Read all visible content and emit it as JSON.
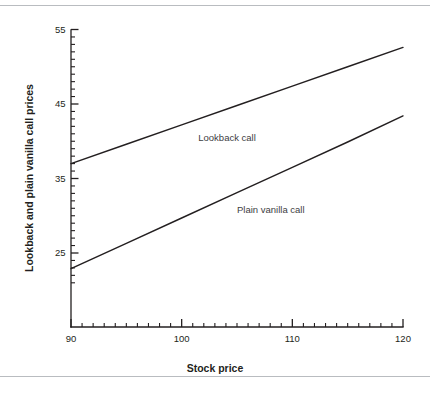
{
  "figure": {
    "background": "#ffffff",
    "rule_color": "#b9bcc0",
    "ink_color": "#231f20",
    "label_color": "#3d3d3f"
  },
  "chart_data": {
    "type": "line",
    "title": "",
    "xlabel": "Stock price",
    "ylabel": "Lookback and plain vanilla call prices",
    "xlim": [
      90,
      120
    ],
    "ylim": [
      20.5,
      55
    ],
    "grid": false,
    "legend_position": "inline-annotation",
    "x_ticks_major": [
      90,
      100,
      110,
      120
    ],
    "x_tick_labels": [
      "90",
      "100",
      "110",
      "120"
    ],
    "x_tick_minor_step": 1,
    "y_ticks_major": [
      25,
      35,
      45,
      55
    ],
    "y_tick_labels": [
      "25",
      "35",
      "45",
      "55"
    ],
    "y_tick_minor_step": 1,
    "x": [
      90,
      95,
      100,
      105,
      110,
      115,
      120
    ],
    "series": [
      {
        "name": "Lookback call",
        "label": "Lookback call",
        "label_x": 101.5,
        "label_y": 40.1,
        "color": "#231f20",
        "values": [
          37.0,
          39.6,
          42.2,
          44.8,
          47.4,
          50.0,
          52.6
        ]
      },
      {
        "name": "Plain vanilla call",
        "label": "Plain vanilla call",
        "label_x": 105.0,
        "label_y": 30.4,
        "color": "#231f20",
        "values": [
          22.9,
          26.3,
          29.7,
          33.1,
          36.5,
          39.9,
          43.4
        ]
      }
    ]
  }
}
